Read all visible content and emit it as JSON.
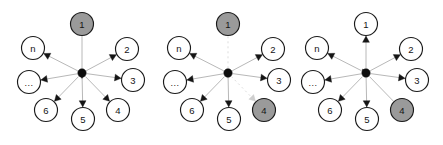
{
  "figure": {
    "background_color": "#ffffff",
    "width": 443,
    "height": 145,
    "node_labels": [
      "1",
      "2",
      "3",
      "4",
      "5",
      "6",
      "...",
      "n"
    ],
    "colors": {
      "node_fill_default": "#ffffff",
      "node_fill_highlight": "#9a9a9a",
      "node_stroke": "#1a1a1a",
      "hub_fill": "#0d0d0d",
      "edge": "#b8b8b8",
      "edge_faded": "#dddddd",
      "arrow": "#151515",
      "arrow_faded": "#cfcfcf",
      "label_text": "#141414"
    },
    "geometry": {
      "hub_radius": 4.2,
      "node_radius": 11.5,
      "hub_y": 73,
      "diagram_centers_x": [
        82,
        228,
        366
      ],
      "node_offsets": [
        {
          "id": "1",
          "dx": 0,
          "dy": -49
        },
        {
          "id": "2",
          "dx": 45,
          "dy": -24
        },
        {
          "id": "3",
          "dx": 51,
          "dy": 7
        },
        {
          "id": "4",
          "dx": 36,
          "dy": 37
        },
        {
          "id": "5",
          "dx": 1,
          "dy": 46
        },
        {
          "id": "6",
          "dx": -36,
          "dy": 37
        },
        {
          "id": "...",
          "dx": -53,
          "dy": 9
        },
        {
          "id": "n",
          "dx": -49,
          "dy": -25
        }
      ]
    },
    "diagrams": [
      {
        "name": "diagram-1",
        "caption": "",
        "index": 1,
        "nodes": [
          {
            "id": "1",
            "label": "1",
            "highlighted": true,
            "edge_direction": "inbound",
            "edge_style": "solid"
          },
          {
            "id": "2",
            "label": "2",
            "highlighted": false,
            "edge_direction": "outbound",
            "edge_style": "solid"
          },
          {
            "id": "3",
            "label": "3",
            "highlighted": false,
            "edge_direction": "outbound",
            "edge_style": "solid"
          },
          {
            "id": "4",
            "label": "4",
            "highlighted": false,
            "edge_direction": "outbound",
            "edge_style": "solid"
          },
          {
            "id": "5",
            "label": "5",
            "highlighted": false,
            "edge_direction": "outbound",
            "edge_style": "solid"
          },
          {
            "id": "6",
            "label": "6",
            "highlighted": false,
            "edge_direction": "outbound",
            "edge_style": "solid"
          },
          {
            "id": "...",
            "label": "...",
            "highlighted": false,
            "edge_direction": "outbound",
            "edge_style": "solid"
          },
          {
            "id": "n",
            "label": "n",
            "highlighted": false,
            "edge_direction": "outbound",
            "edge_style": "solid"
          }
        ]
      },
      {
        "name": "diagram-2",
        "caption": "",
        "index": 2,
        "nodes": [
          {
            "id": "1",
            "label": "1",
            "highlighted": true,
            "edge_direction": "inbound",
            "edge_style": "faded"
          },
          {
            "id": "2",
            "label": "2",
            "highlighted": false,
            "edge_direction": "outbound",
            "edge_style": "solid"
          },
          {
            "id": "3",
            "label": "3",
            "highlighted": false,
            "edge_direction": "outbound",
            "edge_style": "solid"
          },
          {
            "id": "4",
            "label": "4",
            "highlighted": true,
            "edge_direction": "outbound",
            "edge_style": "faded"
          },
          {
            "id": "5",
            "label": "5",
            "highlighted": false,
            "edge_direction": "outbound",
            "edge_style": "solid"
          },
          {
            "id": "6",
            "label": "6",
            "highlighted": false,
            "edge_direction": "outbound",
            "edge_style": "solid"
          },
          {
            "id": "...",
            "label": "...",
            "highlighted": false,
            "edge_direction": "outbound",
            "edge_style": "solid"
          },
          {
            "id": "n",
            "label": "n",
            "highlighted": false,
            "edge_direction": "outbound",
            "edge_style": "solid"
          }
        ]
      },
      {
        "name": "diagram-3",
        "caption": "",
        "index": 3,
        "nodes": [
          {
            "id": "1",
            "label": "1",
            "highlighted": false,
            "edge_direction": "outbound",
            "edge_style": "solid"
          },
          {
            "id": "2",
            "label": "2",
            "highlighted": false,
            "edge_direction": "outbound",
            "edge_style": "solid"
          },
          {
            "id": "3",
            "label": "3",
            "highlighted": false,
            "edge_direction": "outbound",
            "edge_style": "solid"
          },
          {
            "id": "4",
            "label": "4",
            "highlighted": true,
            "edge_direction": "inbound",
            "edge_style": "solid"
          },
          {
            "id": "5",
            "label": "5",
            "highlighted": false,
            "edge_direction": "outbound",
            "edge_style": "solid"
          },
          {
            "id": "6",
            "label": "6",
            "highlighted": false,
            "edge_direction": "outbound",
            "edge_style": "solid"
          },
          {
            "id": "...",
            "label": "...",
            "highlighted": false,
            "edge_direction": "outbound",
            "edge_style": "solid"
          },
          {
            "id": "n",
            "label": "n",
            "highlighted": false,
            "edge_direction": "outbound",
            "edge_style": "solid"
          }
        ]
      }
    ]
  }
}
